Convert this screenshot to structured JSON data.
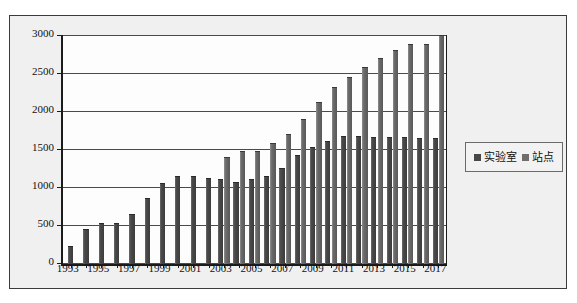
{
  "chart_data": {
    "type": "bar",
    "title": "",
    "subtitle": "",
    "xlabel": "",
    "ylabel": "",
    "ylim": [
      0,
      3000
    ],
    "ytick_step": 500,
    "yticks": [
      "0",
      "500",
      "1000",
      "1500",
      "2000",
      "2500",
      "3000"
    ],
    "grid": true,
    "legend_position": "right",
    "x": [
      1993,
      1994,
      1995,
      1996,
      1997,
      1998,
      1999,
      2000,
      2001,
      2002,
      2003,
      2004,
      2005,
      2006,
      2007,
      2008,
      2009,
      2010,
      2011,
      2012,
      2013,
      2014,
      2015,
      2016,
      2017
    ],
    "categories": [
      "1993",
      "1994",
      "1995",
      "1996",
      "1997",
      "1998",
      "1999",
      "2000",
      "2001",
      "2002",
      "2003",
      "2004",
      "2005",
      "2006",
      "2007",
      "2008",
      "2009",
      "2010",
      "2011",
      "2012",
      "2013",
      "2014",
      "2015",
      "2016",
      "2017"
    ],
    "xtick_labels_shown": [
      "1993",
      "1995",
      "1997",
      "1999",
      "2001",
      "2003",
      "2005",
      "2007",
      "2009",
      "2011",
      "2013",
      "2015",
      "2017"
    ],
    "series": [
      {
        "name": "实验室",
        "color": "#474747",
        "values": [
          230,
          450,
          520,
          520,
          650,
          850,
          1050,
          1150,
          1150,
          1120,
          1100,
          1060,
          1100,
          1150,
          1250,
          1420,
          1520,
          1600,
          1670,
          1670,
          1660,
          1660,
          1660,
          1650,
          1650
        ]
      },
      {
        "name": "站点",
        "color": "#6e6e6e",
        "values": [
          null,
          null,
          null,
          null,
          null,
          null,
          null,
          null,
          null,
          null,
          1400,
          1480,
          1480,
          1580,
          1700,
          1900,
          2120,
          2320,
          2450,
          2580,
          2700,
          2800,
          2880,
          2880,
          3000
        ]
      }
    ]
  },
  "legend": {
    "entries": [
      {
        "label": "实验室",
        "marker": "square-marker",
        "color": "#474747"
      },
      {
        "label": "站点",
        "marker": "square-marker",
        "color": "#6e6e6e"
      }
    ]
  },
  "axes": {
    "y": {
      "ticks": [
        "0",
        "500",
        "1000",
        "1500",
        "2000",
        "2500",
        "3000"
      ]
    },
    "x": {
      "ticks": [
        "1993",
        "1995",
        "1997",
        "1999",
        "2001",
        "2003",
        "2005",
        "2007",
        "2009",
        "2011",
        "2013",
        "2015",
        "2017"
      ]
    }
  }
}
